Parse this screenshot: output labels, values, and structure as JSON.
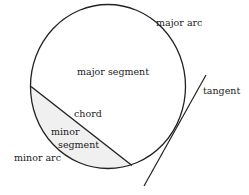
{
  "diagram": {
    "colors": {
      "stroke": "#222222",
      "minor_segment_fill": "#f0f0f0",
      "background": "#ffffff"
    },
    "circle": {
      "cx": 108,
      "cy": 86.5,
      "rx": 77.5,
      "ry": 82
    },
    "chord": {
      "x1": 31,
      "y1": 86.5,
      "x2": 132,
      "y2": 165.5
    },
    "tangent": {
      "x1": 206,
      "y1": 75,
      "x2": 144,
      "y2": 186
    },
    "labels": {
      "major_arc": "major arc",
      "major_segment": "major segment",
      "tangent": "tangent",
      "chord": "chord",
      "minor_segment_line1": "minor",
      "minor_segment_line2": "segment",
      "minor_arc": "minor arc"
    }
  }
}
